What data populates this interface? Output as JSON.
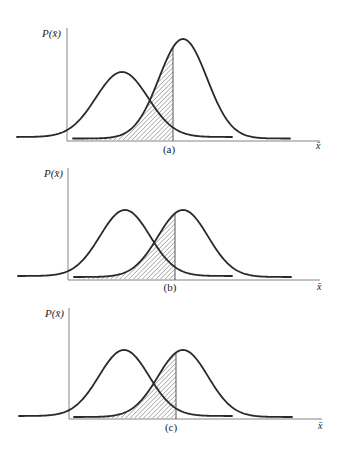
{
  "figure": {
    "panels": [
      {
        "id": "a",
        "caption": "(a)",
        "y_label": "P(x̄)",
        "x_label": "x̄",
        "axis": {
          "x0": 67,
          "yTop": 28,
          "yBase": 141,
          "xEnd": 320
        },
        "curve_left": {
          "mu": 122,
          "sigma": 26,
          "peak_y": 72,
          "base_y": 137,
          "x_start": 17,
          "x_end": 232
        },
        "curve_right": {
          "mu": 183,
          "sigma": 24,
          "peak_y": 39,
          "base_y": 138.5,
          "x_start": 73,
          "x_end": 290
        },
        "cutoff_x": 173,
        "caption_pos": {
          "x": 169,
          "y": 153
        },
        "xlabel_pos": {
          "x": 316,
          "y": 149
        },
        "ylabel_pos": {
          "x": 42,
          "y": 37
        }
      },
      {
        "id": "b",
        "caption": "(b)",
        "y_label": "P(x̄)",
        "x_label": "x̄",
        "axis": {
          "x0": 68,
          "yTop": 168,
          "yBase": 280,
          "xEnd": 320
        },
        "curve_left": {
          "mu": 125,
          "sigma": 25,
          "peak_y": 210,
          "base_y": 276,
          "x_start": 18,
          "x_end": 232
        },
        "curve_right": {
          "mu": 183,
          "sigma": 25,
          "peak_y": 210,
          "base_y": 277,
          "x_start": 74,
          "x_end": 291
        },
        "cutoff_x": 175,
        "caption_pos": {
          "x": 170,
          "y": 291
        },
        "xlabel_pos": {
          "x": 317,
          "y": 290
        },
        "ylabel_pos": {
          "x": 44,
          "y": 177
        }
      },
      {
        "id": "c",
        "caption": "(c)",
        "y_label": "P(x̄)",
        "x_label": "x̄",
        "axis": {
          "x0": 69,
          "yTop": 308,
          "yBase": 419,
          "xEnd": 322
        },
        "curve_left": {
          "mu": 124,
          "sigma": 25,
          "peak_y": 350,
          "base_y": 416,
          "x_start": 19,
          "x_end": 232
        },
        "curve_right": {
          "mu": 183,
          "sigma": 25,
          "peak_y": 350,
          "base_y": 417,
          "x_start": 74,
          "x_end": 292
        },
        "cutoff_x": 176,
        "caption_pos": {
          "x": 171,
          "y": 431
        },
        "xlabel_pos": {
          "x": 318,
          "y": 429
        },
        "ylabel_pos": {
          "x": 45,
          "y": 317
        }
      }
    ]
  },
  "chart_data": [
    {
      "type": "line",
      "title": "(a)",
      "xlabel": "x̄",
      "ylabel": "P(x̄)",
      "series": [
        {
          "name": "distribution-1 (left, wider, lower)",
          "mean_px": 122,
          "sigma_px": 26,
          "relative_height": 0.62
        },
        {
          "name": "distribution-2 (right, taller)",
          "mean_px": 183,
          "sigma_px": 24,
          "relative_height": 0.96
        }
      ],
      "shaded_region": "area under right curve left of cutoff (hatched)",
      "cutoff_px": 173,
      "grid": false
    },
    {
      "type": "line",
      "title": "(b)",
      "xlabel": "x̄",
      "ylabel": "P(x̄)",
      "series": [
        {
          "name": "distribution-1 (left)",
          "mean_px": 125,
          "sigma_px": 25,
          "relative_height": 0.6
        },
        {
          "name": "distribution-2 (right)",
          "mean_px": 183,
          "sigma_px": 25,
          "relative_height": 0.6
        }
      ],
      "shaded_region": "area under right curve left of cutoff (hatched)",
      "cutoff_px": 175,
      "grid": false
    },
    {
      "type": "line",
      "title": "(c)",
      "xlabel": "x̄",
      "ylabel": "P(x̄)",
      "series": [
        {
          "name": "distribution-1 (left)",
          "mean_px": 124,
          "sigma_px": 25,
          "relative_height": 0.6
        },
        {
          "name": "distribution-2 (right)",
          "mean_px": 183,
          "sigma_px": 25,
          "relative_height": 0.6
        }
      ],
      "shaded_region": "area under right curve left of cutoff (hatched), cutoff slightly to the right",
      "cutoff_px": 176,
      "grid": false
    }
  ]
}
